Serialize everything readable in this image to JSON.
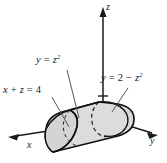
{
  "figure": {
    "kind": "3d-solid-region-sketch",
    "background_color": "#ffffff",
    "ink_color": "#1a1a1a",
    "solid_fill_color": "#dcdcdc",
    "solid_stroke_color": "#111111",
    "leader_line_color": "#555555",
    "axes": {
      "z": {
        "label": "z",
        "direction": "up",
        "arrow": true
      },
      "y": {
        "label": "y",
        "direction": "down-right",
        "arrow": true
      },
      "x": {
        "label": "x",
        "direction": "down-left",
        "arrow": true
      },
      "tick_on_z": true
    },
    "annotations": [
      {
        "name": "curve-left",
        "lhs": "y",
        "relation": "=",
        "rhs_base": "z",
        "rhs_exponent": "2",
        "text": "y = z²"
      },
      {
        "name": "plane",
        "lhs": "x + z",
        "relation": "=",
        "rhs_base": "4",
        "rhs_exponent": "",
        "text": "x + z = 4"
      },
      {
        "name": "curve-right",
        "lhs": "y",
        "relation": "=",
        "rhs_base": "2 − z",
        "rhs_exponent": "2",
        "text": "y = 2 − z²"
      }
    ]
  },
  "labels": {
    "curve_left": {
      "var": "y",
      "eq": "=",
      "base": "z",
      "exp": "2"
    },
    "plane": {
      "var": "x",
      "plus": "+",
      "var2": "z",
      "eq": "=",
      "value": "4"
    },
    "curve_right": {
      "var": "y",
      "eq": "=",
      "two": "2",
      "minus": "−",
      "base": "z",
      "exp": "2"
    },
    "axis_z": "z",
    "axis_y": "y",
    "axis_x": "x"
  }
}
